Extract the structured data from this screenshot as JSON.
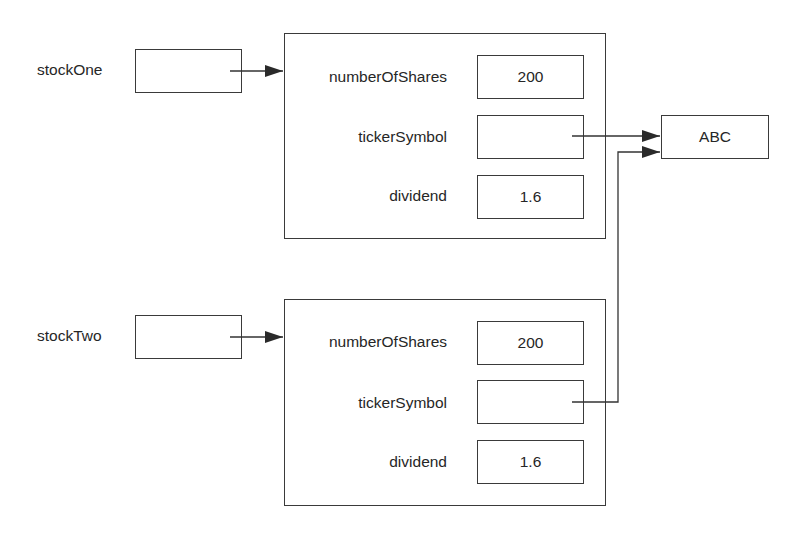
{
  "diagram": {
    "references": [
      {
        "name": "stockOne",
        "target": "object1"
      },
      {
        "name": "stockTwo",
        "target": "object2"
      }
    ],
    "objects": [
      {
        "id": "object1",
        "fields": [
          {
            "name": "numberOfShares",
            "value": "200"
          },
          {
            "name": "tickerSymbol",
            "value": ""
          },
          {
            "name": "dividend",
            "value": "1.6"
          }
        ]
      },
      {
        "id": "object2",
        "fields": [
          {
            "name": "numberOfShares",
            "value": "200"
          },
          {
            "name": "tickerSymbol",
            "value": ""
          },
          {
            "name": "dividend",
            "value": "1.6"
          }
        ]
      }
    ],
    "shared_string": {
      "value": "ABC"
    },
    "colors": {
      "line": "#3a3a3a",
      "text": "#262626",
      "background": "#ffffff"
    }
  }
}
